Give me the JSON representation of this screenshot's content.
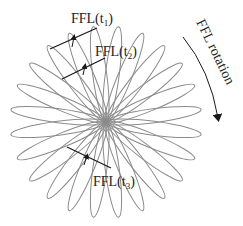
{
  "diagram": {
    "rosette": {
      "center": [
        106,
        122
      ],
      "petal_count": 24,
      "petal_length": 96,
      "petal_half_width": 7,
      "start_angle_deg": 7.5,
      "stroke_color": "#8a8a8a"
    },
    "ffl_lines": [
      {
        "label_main": "FFL(t",
        "label_sub": "1",
        "label_close": ")",
        "line": [
          50,
          49,
          97,
          28
        ],
        "arrow": [
          72,
          47,
          74,
          37
        ],
        "label_pos": [
          71,
          23
        ]
      },
      {
        "label_main": "FFL(t",
        "label_sub": "2",
        "label_close": ")",
        "line": [
          62,
          79,
          105,
          58
        ],
        "arrow": [
          83,
          75,
          85,
          66
        ],
        "label_pos": [
          95,
          56
        ]
      },
      {
        "label_main": "FFL(t",
        "label_sub": "3",
        "label_close": ")",
        "line": [
          67,
          147,
          111,
          168
        ],
        "arrow": [
          84,
          165,
          87,
          156
        ],
        "label_pos": [
          93,
          186
        ]
      }
    ],
    "rotation": {
      "label": "FFL rotation",
      "arrow_path": "M183 37 Q210 70 218 118",
      "label_pos": [
        196,
        22
      ],
      "label_angle_deg": 64
    },
    "line_color": "#1a1a1a"
  }
}
